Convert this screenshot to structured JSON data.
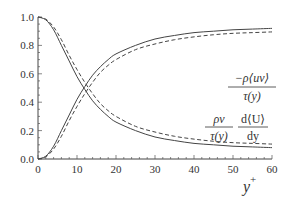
{
  "chart_data": {
    "type": "line",
    "title": "",
    "xlabel": "y+",
    "ylabel": "",
    "xlim": [
      0,
      60
    ],
    "ylim": [
      0,
      1.0
    ],
    "grid": false,
    "x_ticks": [
      "0",
      "10",
      "20",
      "30",
      "40",
      "50",
      "60"
    ],
    "y_ticks": [
      "0.0",
      "0.2",
      "0.4",
      "0.6",
      "0.8",
      "1.0"
    ],
    "x": [
      0,
      2,
      4,
      6,
      8,
      10,
      12,
      14,
      16,
      18,
      20,
      25,
      30,
      35,
      40,
      45,
      50,
      55,
      60
    ],
    "series": [
      {
        "name": "Reynolds shear stress fraction (solid)",
        "style": "solid",
        "values": [
          0.0,
          0.02,
          0.09,
          0.2,
          0.31,
          0.42,
          0.51,
          0.59,
          0.65,
          0.7,
          0.74,
          0.8,
          0.845,
          0.87,
          0.89,
          0.9,
          0.91,
          0.915,
          0.92
        ]
      },
      {
        "name": "Reynolds shear stress fraction (dashed)",
        "style": "dashed",
        "values": [
          0.0,
          0.015,
          0.07,
          0.16,
          0.27,
          0.37,
          0.46,
          0.54,
          0.61,
          0.66,
          0.7,
          0.77,
          0.81,
          0.84,
          0.86,
          0.875,
          0.885,
          0.89,
          0.895
        ]
      },
      {
        "name": "Viscous stress fraction (solid)",
        "style": "solid",
        "values": [
          1.0,
          0.98,
          0.91,
          0.8,
          0.69,
          0.58,
          0.49,
          0.41,
          0.35,
          0.3,
          0.26,
          0.2,
          0.155,
          0.13,
          0.11,
          0.1,
          0.09,
          0.085,
          0.08
        ]
      },
      {
        "name": "Viscous stress fraction (dashed)",
        "style": "dashed",
        "values": [
          1.0,
          0.985,
          0.93,
          0.84,
          0.73,
          0.63,
          0.54,
          0.46,
          0.39,
          0.34,
          0.3,
          0.23,
          0.19,
          0.16,
          0.14,
          0.125,
          0.115,
          0.11,
          0.105
        ]
      }
    ],
    "annotations": [
      {
        "text": "−ρ⟨uv⟩ / τ(y)",
        "near_series": "upper curves"
      },
      {
        "text": "ρν/τ(y) · d⟨U⟩/dy",
        "near_series": "lower curves"
      }
    ]
  },
  "labels": {
    "ann1_num": "−ρ⟨uv⟩",
    "ann1_den": "τ(y)",
    "ann2a_num": "ρν",
    "ann2a_den": "τ(y)",
    "ann2b_num": "d⟨U⟩",
    "ann2b_den": "dy",
    "xlabel_base": "y",
    "xlabel_sup": "+"
  }
}
